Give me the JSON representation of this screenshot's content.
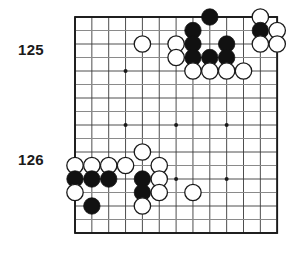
{
  "diagram": {
    "kind": "go-board-diagram",
    "background_color": "#ffffff",
    "line_color": "#3a3a3a",
    "grid_line_color": "#8a8a8a",
    "border_color": "#1a1a1a",
    "black_stone_color": "#111111",
    "white_stone_fill": "#ffffff",
    "white_stone_stroke": "#1a1a1a"
  },
  "labels": [
    {
      "name": "move-number-125",
      "text": "125",
      "x": 18,
      "y": 41
    },
    {
      "name": "move-number-126",
      "text": "126",
      "x": 18,
      "y": 151
    }
  ],
  "board": {
    "origin_x": 75,
    "origin_y": 17,
    "cell_w": 16.85,
    "cell_h": 13.5,
    "cols": 12,
    "rows": 16,
    "stone_radius": 8.2,
    "star_radius": 2.0,
    "star_points": [
      {
        "col": 3,
        "row": 4
      },
      {
        "col": 3,
        "row": 8
      },
      {
        "col": 6,
        "row": 8
      },
      {
        "col": 9,
        "row": 8
      },
      {
        "col": 6,
        "row": 12
      },
      {
        "col": 9,
        "row": 12
      }
    ],
    "stones": [
      {
        "color": "black",
        "col": 8,
        "row": 0
      },
      {
        "color": "white",
        "col": 11,
        "row": 0
      },
      {
        "color": "black",
        "col": 7,
        "row": 1
      },
      {
        "color": "black",
        "col": 11,
        "row": 1
      },
      {
        "color": "white",
        "col": 12,
        "row": 1
      },
      {
        "color": "white",
        "col": 4,
        "row": 2
      },
      {
        "color": "white",
        "col": 6,
        "row": 2
      },
      {
        "color": "black",
        "col": 7,
        "row": 2
      },
      {
        "color": "black",
        "col": 9,
        "row": 2
      },
      {
        "color": "white",
        "col": 11,
        "row": 2
      },
      {
        "color": "white",
        "col": 12,
        "row": 2
      },
      {
        "color": "white",
        "col": 6,
        "row": 3
      },
      {
        "color": "black",
        "col": 7,
        "row": 3
      },
      {
        "color": "black",
        "col": 8,
        "row": 3
      },
      {
        "color": "black",
        "col": 9,
        "row": 3
      },
      {
        "color": "white",
        "col": 7,
        "row": 4
      },
      {
        "color": "white",
        "col": 8,
        "row": 4
      },
      {
        "color": "white",
        "col": 9,
        "row": 4
      },
      {
        "color": "white",
        "col": 10,
        "row": 4
      },
      {
        "color": "white",
        "col": 4,
        "row": 10
      },
      {
        "color": "white",
        "col": 0,
        "row": 11
      },
      {
        "color": "white",
        "col": 1,
        "row": 11
      },
      {
        "color": "white",
        "col": 2,
        "row": 11
      },
      {
        "color": "white",
        "col": 3,
        "row": 11
      },
      {
        "color": "white",
        "col": 5,
        "row": 11
      },
      {
        "color": "black",
        "col": 0,
        "row": 12
      },
      {
        "color": "black",
        "col": 1,
        "row": 12
      },
      {
        "color": "black",
        "col": 2,
        "row": 12
      },
      {
        "color": "black",
        "col": 4,
        "row": 12
      },
      {
        "color": "white",
        "col": 5,
        "row": 12
      },
      {
        "color": "white",
        "col": 0,
        "row": 13
      },
      {
        "color": "black",
        "col": 4,
        "row": 13
      },
      {
        "color": "white",
        "col": 5,
        "row": 13
      },
      {
        "color": "white",
        "col": 7,
        "row": 13
      },
      {
        "color": "black",
        "col": 1,
        "row": 14
      },
      {
        "color": "white",
        "col": 4,
        "row": 14
      }
    ]
  }
}
